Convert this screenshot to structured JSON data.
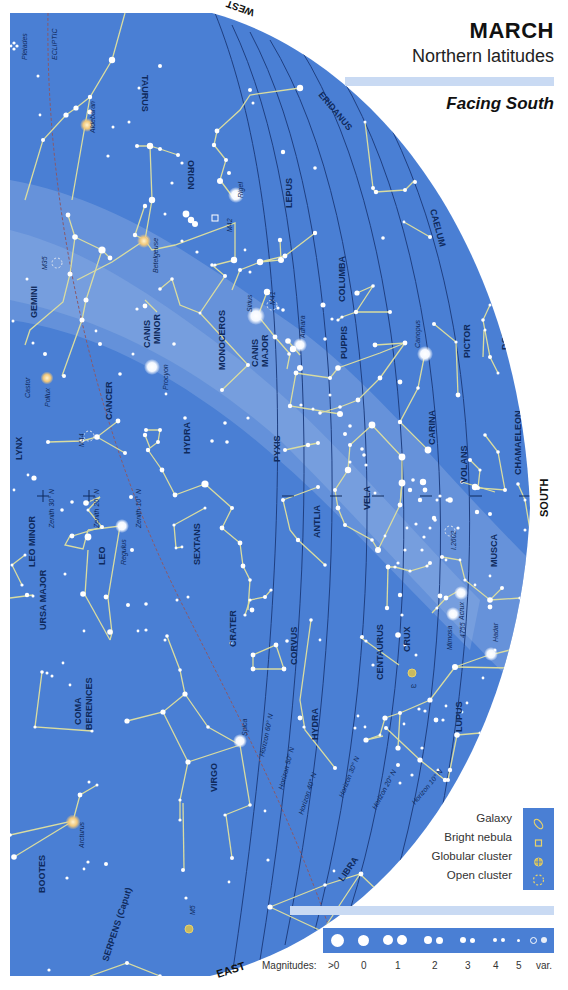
{
  "header": {
    "title": "MARCH",
    "subtitle": "Northern latitudes",
    "facing": "Facing South"
  },
  "directions": {
    "west": "WEST",
    "south": "SOUTH",
    "east": "EAST"
  },
  "colors": {
    "sky": "#4a7fd4",
    "sky_light": "#7ea3df",
    "constellation_line": "#d9dca0",
    "star": "#ffffff",
    "warm_star": "#f1c77a",
    "horizon_line": "#1f3f80",
    "ecliptic": "#8a5a6a",
    "deep_sky_symbol": "#e8d26a",
    "band": "#c9daf3"
  },
  "constellations": [
    "TAURUS",
    "ORION",
    "ERIDANUS",
    "LEPUS",
    "CAELUM",
    "GEMINI",
    "CANIS MINOR",
    "MONOCEROS",
    "CANIS MAJOR",
    "COLUMBA",
    "PUPPIS",
    "PICTOR",
    "DORADO",
    "CANCER",
    "CARINA",
    "VOLANS",
    "CHAMAELEON",
    "LYNX",
    "HYDRA",
    "PYXIS",
    "ANTLIA",
    "VELA",
    "MUSCA",
    "LEO MINOR",
    "LEO",
    "SEXTANS",
    "URSA MAJOR",
    "CRATER",
    "CORVUS",
    "CRUX",
    "CENTAURUS",
    "COMA BERENICES",
    "LUPUS",
    "VIRGO",
    "BOOTES",
    "LIBRA",
    "SERPENS (Caput)"
  ],
  "stars": [
    "Aldebaran",
    "Rigel",
    "Betelgeuse",
    "Sirius",
    "Adhara",
    "Procyon",
    "Canopus",
    "Castor",
    "Pollux",
    "Regulus",
    "Acrux",
    "Mimosa",
    "Hadar",
    "Spica",
    "Arcturus"
  ],
  "deep_sky": [
    "Pleiades",
    "M42",
    "M41",
    "M35",
    "M44",
    "I.2602",
    "4755",
    "ω",
    "M5"
  ],
  "reference_lines": {
    "ecliptic": "ECLIPTIC",
    "zenith": [
      "Zenith 30° N",
      "Zenith 20° N",
      "Zenith 10° N"
    ],
    "horizon": [
      "Horizon 60° N",
      "Horizon 50° N",
      "Horizon 40° N",
      "Horizon 30° N",
      "Horizon 20° N",
      "Horizon 10° N"
    ]
  },
  "legend": {
    "items": [
      {
        "label": "Galaxy",
        "icon": "galaxy-icon"
      },
      {
        "label": "Bright nebula",
        "icon": "nebula-icon"
      },
      {
        "label": "Globular cluster",
        "icon": "globular-cluster-icon"
      },
      {
        "label": "Open cluster",
        "icon": "open-cluster-icon"
      }
    ]
  },
  "magnitudes": {
    "label": "Magnitudes:",
    "scale": [
      ">0",
      "0",
      "1",
      "2",
      "3",
      "4",
      "5",
      "var."
    ]
  }
}
